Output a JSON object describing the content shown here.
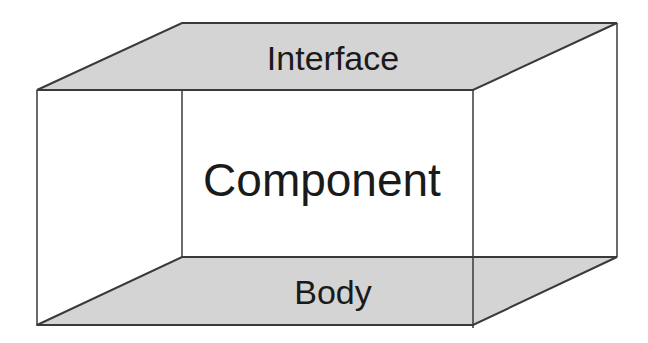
{
  "diagram": {
    "type": "3d-box",
    "labels": {
      "top_face": "Interface",
      "front_center": "Component",
      "bottom_face": "Body"
    },
    "colors": {
      "face_fill": "#d4d4d4",
      "stroke": "#3a3a3a",
      "background": "#ffffff",
      "text": "#1a1a1a"
    }
  }
}
